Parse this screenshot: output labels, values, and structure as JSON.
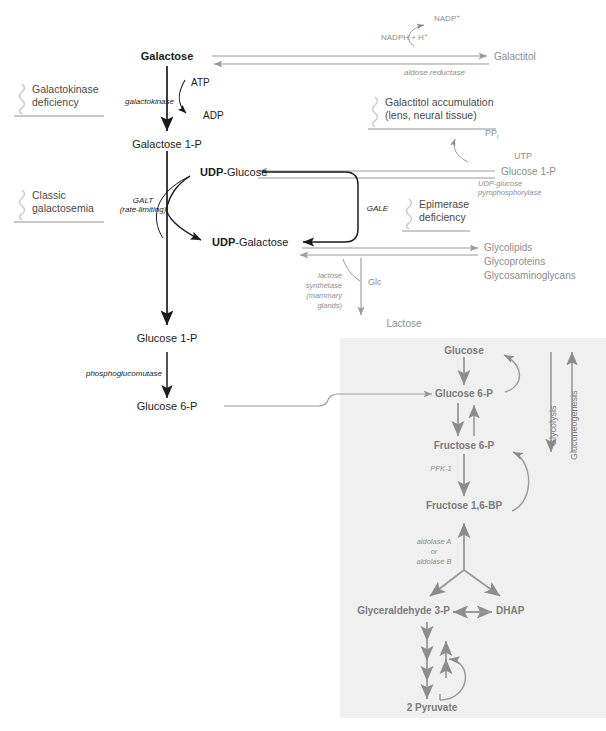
{
  "figure": {
    "colors": {
      "dark_arrow": "#1b1b1b",
      "gray_arrow": "#8d8d8d",
      "panel_background": "#f0f0f0",
      "page_background": "#ffffff",
      "squiggle": "#c9c9c9"
    }
  },
  "metabolites": {
    "galactose": "Galactose",
    "galactose_1p": "Galactose 1-P",
    "glucose_1p_left": "Glucose 1-P",
    "glucose_6p_left": "Glucose 6-P",
    "udp_glucose_bold": "UDP",
    "udp_glucose_rest": "-Glucose",
    "udp_galactose_bold": "UDP",
    "udp_galactose_rest": "-Galactose",
    "galactitol": "Galactitol",
    "glucose_1p_right": "Glucose 1-P",
    "lactose": "Lactose",
    "glc": "Glc"
  },
  "cofactors": {
    "atp": "ATP",
    "adp": "ADP",
    "nadph_h": "NADPH + H⁺",
    "nadp_plus": "NADP⁺",
    "utp": "UTP",
    "ppi_main": "PP",
    "ppi_sub": "i"
  },
  "enzymes": {
    "galactokinase": "galactokinase",
    "aldose_reductase": "aldose reductase",
    "galt": "GALT",
    "galt_note": "(rate-limiting)",
    "gale": "GALE",
    "udp_glucose_pyrophosphorylase_line1": "UDP-glucose",
    "udp_glucose_pyrophosphorylase_line2": "pyrophosphorylase",
    "phosphoglucomutase": "phosphoglucomutase",
    "lactose_synthetase_line1": "lactose",
    "lactose_synthetase_line2": "synthetase",
    "lactose_synthetase_line3": "(mammary",
    "lactose_synthetase_line4": "glands)",
    "pfk1": "PFK-1",
    "aldolase_line1": "aldolase A",
    "aldolase_line2": "or",
    "aldolase_line3": "aldolase B"
  },
  "deficiencies": [
    {
      "id": "galactokinase-deficiency",
      "line1": "Galactokinase",
      "line2": "deficiency"
    },
    {
      "id": "classic-galactosemia",
      "line1": "Classic",
      "line2": "galactosemia"
    },
    {
      "id": "galactitol-accumulation",
      "line1": "Galactitol accumulation",
      "line2": "(lens, neural tissue)"
    },
    {
      "id": "epimerase-deficiency",
      "line1": "Epimerase",
      "line2": "deficiency"
    }
  ],
  "products": {
    "line1": "Glycolipids",
    "line2": "Glycoproteins",
    "line3": "Glycosaminoglycans"
  },
  "glycolysis_panel": {
    "glucose": "Glucose",
    "glucose_6p": "Glucose 6-P",
    "fructose_6p": "Fructose 6-P",
    "fructose_16bp": "Fructose 1,6-BP",
    "glyceraldehyde_3p": "Glyceraldehyde 3-P",
    "dhap": "DHAP",
    "pyruvate": "2 Pyruvate",
    "glycolysis_label": "Glycolysis",
    "gluconeogenesis_label": "Gluconeogenesis"
  }
}
